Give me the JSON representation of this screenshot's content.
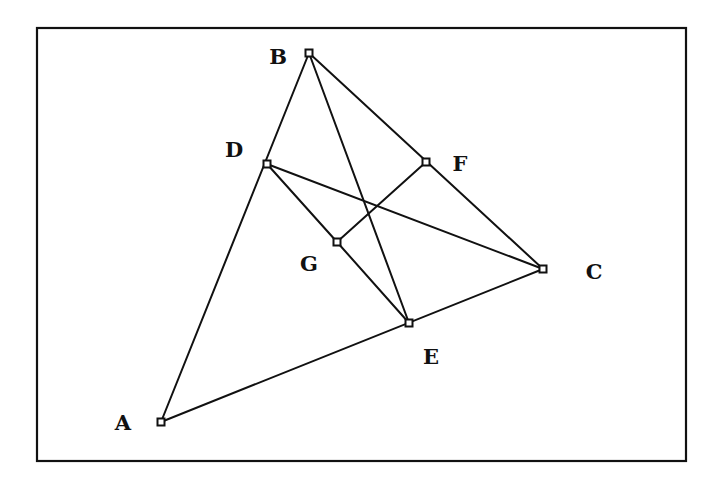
{
  "frame": {
    "x": 37,
    "y": 28,
    "width": 649,
    "height": 433
  },
  "points": [
    {
      "id": "A",
      "label": "A",
      "x": 161,
      "y": 422,
      "lx": 123,
      "ly": 430
    },
    {
      "id": "B",
      "label": "B",
      "x": 309,
      "y": 53,
      "lx": 278,
      "ly": 64
    },
    {
      "id": "C",
      "label": "C",
      "x": 543,
      "y": 269,
      "lx": 594,
      "ly": 279
    },
    {
      "id": "D",
      "label": "D",
      "x": 267,
      "y": 164,
      "lx": 234,
      "ly": 157
    },
    {
      "id": "E",
      "label": "E",
      "x": 409,
      "y": 323,
      "lx": 431,
      "ly": 364
    },
    {
      "id": "F",
      "label": "F",
      "x": 426,
      "y": 162,
      "lx": 460,
      "ly": 171
    },
    {
      "id": "G",
      "label": "G",
      "x": 337,
      "y": 242,
      "lx": 309,
      "ly": 271
    }
  ],
  "segments": [
    [
      "A",
      "B"
    ],
    [
      "A",
      "C"
    ],
    [
      "B",
      "C"
    ],
    [
      "B",
      "E"
    ],
    [
      "D",
      "C"
    ],
    [
      "D",
      "G"
    ],
    [
      "G",
      "E"
    ],
    [
      "G",
      "F"
    ]
  ]
}
